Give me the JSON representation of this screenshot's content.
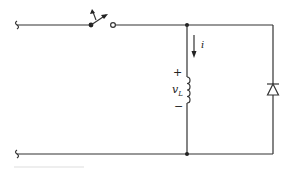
{
  "diagram": {
    "type": "circuit-schematic",
    "colors": {
      "line": "#333333",
      "background": "#ffffff"
    },
    "components": [
      {
        "id": "switch",
        "kind": "switch-open",
        "label": ""
      },
      {
        "id": "inductor",
        "kind": "inductor",
        "label": "vL"
      },
      {
        "id": "diode",
        "kind": "diode",
        "orientation": "cathode-up",
        "label": ""
      }
    ],
    "labels": {
      "current": "i",
      "voltage_main": "v",
      "voltage_sub": "L",
      "plus": "+",
      "minus": "−"
    }
  }
}
